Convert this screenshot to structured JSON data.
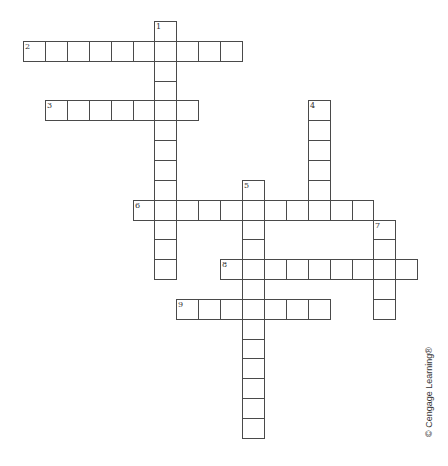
{
  "puzzle": {
    "type": "crossword",
    "entries": [
      {
        "number": "1",
        "direction": "down",
        "row": 0,
        "col": 6,
        "length": 13
      },
      {
        "number": "2",
        "direction": "across",
        "row": 1,
        "col": 0,
        "length": 10
      },
      {
        "number": "3",
        "direction": "across",
        "row": 4,
        "col": 1,
        "length": 7
      },
      {
        "number": "4",
        "direction": "down",
        "row": 4,
        "col": 13,
        "length": 6
      },
      {
        "number": "5",
        "direction": "down",
        "row": 8,
        "col": 10,
        "length": 13
      },
      {
        "number": "6",
        "direction": "across",
        "row": 9,
        "col": 5,
        "length": 11
      },
      {
        "number": "7",
        "direction": "down",
        "row": 10,
        "col": 16,
        "length": 5
      },
      {
        "number": "8",
        "direction": "across",
        "row": 12,
        "col": 9,
        "length": 9
      },
      {
        "number": "9",
        "direction": "across",
        "row": 14,
        "col": 7,
        "length": 7
      }
    ]
  },
  "footer": {
    "copyright": "© Cengage Learning®"
  },
  "colors": {
    "grid_line": "#4a4a4a",
    "cell_fill": "#ffffff",
    "text": "#333333"
  }
}
